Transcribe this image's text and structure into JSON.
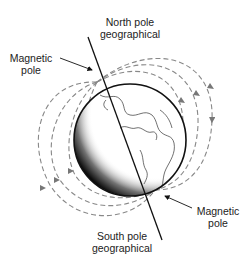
{
  "diagram": {
    "type": "earth-magnetic-field",
    "labels": {
      "north_geo": [
        "North pole",
        "geographical"
      ],
      "south_geo": [
        "South pole",
        "geographical"
      ],
      "magnetic_north": [
        "Magnetic",
        "pole"
      ],
      "magnetic_south": [
        "Magnetic",
        "pole"
      ]
    },
    "colors": {
      "line": "#111111",
      "field_lines": "#777777",
      "shadow": "#000000",
      "text": "#222222"
    }
  }
}
